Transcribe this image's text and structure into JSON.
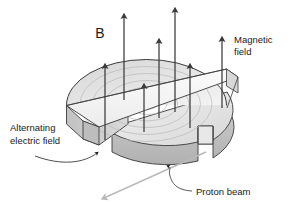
{
  "figure": {
    "title_symbol": "B",
    "labels": {
      "magnetic_field_line1": "Magnetic",
      "magnetic_field_line2": "field",
      "alternating_field_line1": "Alternating",
      "alternating_field_line2": "electric field",
      "proton_beam": "Proton beam"
    },
    "colors": {
      "background": "#ffffff",
      "outline": "#2b2b2b",
      "arrow": "#3a3a3a",
      "disk_top": "#e3e3e3",
      "disk_top_light": "#f2f2f2",
      "disk_side": "#c9c9c9",
      "disk_side_dark": "#b4b4b4",
      "gap_strip": "#f7f7f7",
      "spiral": "#b9b9b9",
      "beam": "#b9b9b9",
      "text": "#1a1a1a"
    },
    "field_arrow_count": 7,
    "diagram_type": "cyclotron-schematic"
  }
}
